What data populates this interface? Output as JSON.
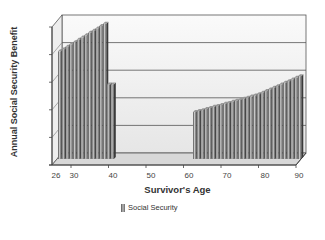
{
  "chart_data": {
    "type": "bar",
    "style": "3d-column",
    "title": "",
    "xlabel": "Survivor's Age",
    "ylabel": "Annual Social Security Benefit",
    "x_tick_labels": [
      "26",
      "30",
      "40",
      "50",
      "60",
      "70",
      "80",
      "90"
    ],
    "y_tick_labels": [],
    "xlim": [
      26,
      90
    ],
    "ylim": [
      0,
      5
    ],
    "y_units_note": "values in relative gridline units (unlabeled axis)",
    "grid": true,
    "legend": {
      "position": "bottom",
      "entries": [
        "Social Security"
      ]
    },
    "series": [
      {
        "name": "Social Security",
        "x": [
          26,
          27,
          28,
          29,
          30,
          31,
          32,
          33,
          34,
          35,
          36,
          37,
          38,
          39,
          40,
          62,
          63,
          64,
          65,
          66,
          67,
          68,
          69,
          70,
          71,
          72,
          73,
          74,
          75,
          76,
          77,
          78,
          79,
          80,
          81,
          82,
          83,
          84,
          85,
          86,
          87,
          88,
          89,
          90
        ],
        "values": [
          3.9,
          3.98,
          4.07,
          4.15,
          4.23,
          4.32,
          4.4,
          4.48,
          4.57,
          4.65,
          4.73,
          4.82,
          4.9,
          2.7,
          2.7,
          1.7,
          1.74,
          1.77,
          1.81,
          1.85,
          1.89,
          1.92,
          1.96,
          2.0,
          2.03,
          2.07,
          2.11,
          2.14,
          2.18,
          2.22,
          2.26,
          2.3,
          2.35,
          2.4,
          2.46,
          2.52,
          2.58,
          2.64,
          2.7,
          2.76,
          2.82,
          2.88,
          2.94,
          3.0
        ]
      }
    ]
  },
  "labels": {
    "xlabel": "Survivor's Age",
    "ylabel": "Annual Social Security Benefit",
    "legend_entry": "Social Security"
  },
  "ticks": [
    "26",
    "30",
    "40",
    "50",
    "60",
    "70",
    "80",
    "90"
  ]
}
